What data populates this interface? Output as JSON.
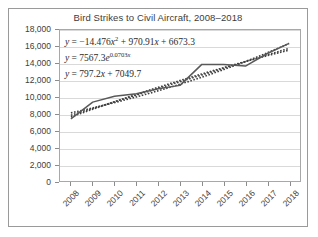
{
  "chart_data": {
    "type": "line",
    "title": "Bird Strikes to Civil Aircraft, 2008–2018",
    "xlabel": "",
    "ylabel": "",
    "grid": true,
    "legend": "none",
    "ylim": [
      0,
      18000
    ],
    "yticks": [
      "0",
      "2,000",
      "4,000",
      "6,000",
      "8,000",
      "10,000",
      "12,000",
      "14,000",
      "16,000",
      "18,000"
    ],
    "ytick_values": [
      0,
      2000,
      4000,
      6000,
      8000,
      10000,
      12000,
      14000,
      16000,
      18000
    ],
    "categories": [
      "2008",
      "2009",
      "2010",
      "2011",
      "2012",
      "2013",
      "2014",
      "2015",
      "2016",
      "2017",
      "2018"
    ],
    "x": [
      1,
      2,
      3,
      4,
      5,
      6,
      7,
      8,
      9,
      10,
      11
    ],
    "series": [
      {
        "name": "Bird strikes",
        "style": "solid",
        "color": "#595959",
        "values": [
          7400,
          9400,
          10100,
          10400,
          11000,
          11400,
          13900,
          13900,
          13700,
          15200,
          16400
        ]
      }
    ],
    "trendlines": [
      {
        "name": "polynomial",
        "style": "dotted",
        "color": "#404040",
        "equation": "y = −14.476x² + 970.91x + 6673.3",
        "coefficients": {
          "a": -14.476,
          "b": 970.91,
          "c": 6673.3
        }
      },
      {
        "name": "exponential",
        "style": "dotted",
        "color": "#404040",
        "equation": "y = 7567.3e^(0.0703x)",
        "coefficients": {
          "a": 7567.3,
          "b": 0.0703
        }
      },
      {
        "name": "linear",
        "style": "dotted",
        "color": "#404040",
        "equation": "y = 797.2x + 7049.7",
        "coefficients": {
          "m": 797.2,
          "b": 7049.7
        }
      }
    ],
    "annotations": {
      "eq1_prefix": "y",
      "eq1_body": " = −14.476",
      "eq1_var": "x",
      "eq1_sup": "2",
      "eq1_mid": " + 970.91",
      "eq1_var2": "x",
      "eq1_tail": " + 6673.3",
      "eq2_prefix": "y",
      "eq2_body": " = 7567.3",
      "eq2_e": "e",
      "eq2_sup": "0.0703",
      "eq2_supvar": "x",
      "eq3_prefix": "y",
      "eq3_body": " = 797.2",
      "eq3_var": "x",
      "eq3_tail": " + 7049.7"
    }
  }
}
